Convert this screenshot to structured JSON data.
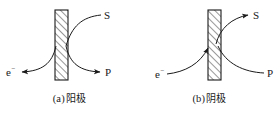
{
  "figure": {
    "background_color": "#ffffff",
    "stroke_color": "#1a1a1a",
    "panels": [
      {
        "id": "a",
        "caption_index": "(a)",
        "caption_text": "阳极",
        "caption_full": "(a) 阳极",
        "electrode_type": "anode",
        "plate": {
          "name": "electrode-plate",
          "hatch_direction": "forward-slash",
          "x": 55,
          "y": 10,
          "width": 13,
          "height": 70
        },
        "labels": {
          "s": "S",
          "p": "P",
          "electron": "e",
          "electron_charge": "−"
        },
        "arrows": [
          {
            "name": "arrow-to-s",
            "from": "plate",
            "to": "S",
            "arrowhead": false
          },
          {
            "name": "arrow-to-p",
            "from": "plate",
            "to": "P",
            "arrowhead": true
          },
          {
            "name": "arrow-to-electron",
            "from": "plate",
            "to": "e-",
            "arrowhead": true
          }
        ]
      },
      {
        "id": "b",
        "caption_index": "(b)",
        "caption_text": "阴极",
        "caption_full": "(b) 阴极",
        "electrode_type": "cathode",
        "plate": {
          "name": "electrode-plate",
          "hatch_direction": "forward-slash",
          "x": 68,
          "y": 10,
          "width": 13,
          "height": 70
        },
        "labels": {
          "s": "S",
          "p": "P",
          "electron": "e",
          "electron_charge": "−"
        },
        "arrows": [
          {
            "name": "arrow-to-s",
            "from": "plate",
            "to": "S",
            "arrowhead": true
          },
          {
            "name": "arrow-from-p",
            "from": "P",
            "to": "plate",
            "arrowhead": false
          },
          {
            "name": "arrow-from-electron",
            "from": "e-",
            "to": "plate",
            "arrowhead": true
          }
        ]
      }
    ]
  }
}
